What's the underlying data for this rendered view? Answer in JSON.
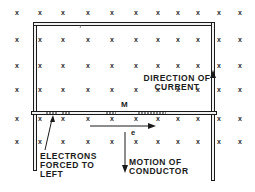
{
  "diagram": {
    "field_symbol": "x",
    "field_grid": {
      "columns_x": [
        17,
        40,
        63,
        88,
        112,
        136,
        158,
        178,
        198,
        219,
        240
      ],
      "rows_y": [
        13,
        40,
        66,
        90,
        119,
        142
      ]
    },
    "labels": {
      "conductor": "M",
      "direction_of_current_line1": "DIRECTION OF",
      "direction_of_current_line2": "CURRENT",
      "electron_symbol": "e",
      "motion_line1": "MOTION OF",
      "motion_line2": "CONDUCTOR",
      "electrons_line1": "ELECTRONS",
      "electrons_line2": "FORCED TO",
      "electrons_line3": "LEFT"
    },
    "colors": {
      "ink": "#1a1a1a",
      "background": "#ffffff",
      "wire_fill": "#f2f2f2"
    }
  }
}
